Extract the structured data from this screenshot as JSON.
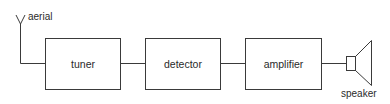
{
  "diagram": {
    "type": "block-diagram",
    "colors": {
      "stroke": "#3a3a3a",
      "text": "#2a2a2a",
      "background": "#ffffff"
    },
    "antenna": {
      "label": "aerial",
      "icon": "antenna-icon"
    },
    "blocks": [
      {
        "id": "tuner",
        "label": "tuner"
      },
      {
        "id": "detector",
        "label": "detector"
      },
      {
        "id": "amplifier",
        "label": "amplifier"
      }
    ],
    "output": {
      "label": "speaker",
      "icon": "speaker-icon"
    },
    "connections": [
      [
        "aerial",
        "tuner"
      ],
      [
        "tuner",
        "detector"
      ],
      [
        "detector",
        "amplifier"
      ],
      [
        "amplifier",
        "speaker"
      ]
    ]
  }
}
